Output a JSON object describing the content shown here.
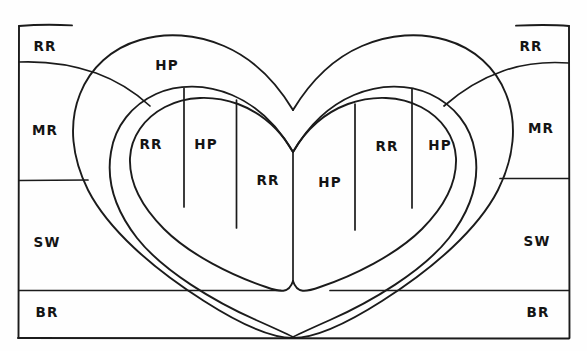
{
  "figure": {
    "kind": "hand-drawn-heart-quilting-pattern-diagram",
    "ink_color": "#1b1b1b",
    "background_color": "#ffffff",
    "canvas": {
      "width": 587,
      "height": 351
    }
  },
  "legend_codes": {
    "RR": "RR",
    "HP": "HP",
    "MR": "MR",
    "SW": "SW",
    "BR": "BR"
  },
  "labels": {
    "outer_left": [
      {
        "id": "left-rr",
        "text": "RR",
        "x": 45,
        "y": 47
      },
      {
        "id": "left-mr",
        "text": "MR",
        "x": 45,
        "y": 131
      },
      {
        "id": "left-sw",
        "text": "SW",
        "x": 47,
        "y": 243
      },
      {
        "id": "left-br",
        "text": "BR",
        "x": 47,
        "y": 313
      }
    ],
    "outer_right": [
      {
        "id": "right-rr",
        "text": "RR",
        "x": 531,
        "y": 47
      },
      {
        "id": "right-mr",
        "text": "MR",
        "x": 541,
        "y": 129
      },
      {
        "id": "right-sw",
        "text": "SW",
        "x": 537,
        "y": 242
      },
      {
        "id": "right-br",
        "text": "BR",
        "x": 538,
        "y": 313
      }
    ],
    "heart_band": [
      {
        "id": "band-hp",
        "text": "HP",
        "x": 167,
        "y": 66
      }
    ],
    "heart_inner": [
      {
        "id": "inner-1",
        "text": "RR",
        "x": 151,
        "y": 145
      },
      {
        "id": "inner-2",
        "text": "HP",
        "x": 206,
        "y": 145
      },
      {
        "id": "inner-3",
        "text": "RR",
        "x": 268,
        "y": 181
      },
      {
        "id": "inner-4",
        "text": "HP",
        "x": 330,
        "y": 183
      },
      {
        "id": "inner-5",
        "text": "RR",
        "x": 387,
        "y": 147
      },
      {
        "id": "inner-6",
        "text": "HP",
        "x": 440,
        "y": 146
      }
    ]
  },
  "geometry": {
    "border_rect": {
      "left": 18,
      "top": 25,
      "right": 569,
      "bottom": 338
    },
    "horizontal_band_lines": [
      {
        "id": "left-rr-mr",
        "y": 62,
        "x_from": 18,
        "x_to": 62
      },
      {
        "id": "right-rr-mr",
        "y": 63,
        "x_from": 524,
        "x_to": 569
      },
      {
        "id": "left-mr-sw",
        "y": 180,
        "x_from": 18,
        "x_to": 88
      },
      {
        "id": "right-mr-sw",
        "y": 178,
        "x_from": 500,
        "x_to": 569
      },
      {
        "id": "left-sw-br",
        "y": 290,
        "x_from": 18,
        "x_to": 281
      },
      {
        "id": "right-sw-br",
        "y": 290,
        "x_from": 330,
        "x_to": 569
      }
    ],
    "heart": {
      "outer_top_notch_y": 110,
      "outer_bottom_point": {
        "x": 293,
        "y": 338
      },
      "mid_top_notch_y": 152,
      "mid_bottom_point": {
        "x": 293,
        "y": 281
      },
      "inner_top_notch_y": 152,
      "inner_bottom_point": {
        "x": 293,
        "y": 281
      }
    },
    "inner_dividers": [
      {
        "id": "div-1",
        "x_top": 184,
        "y_top": 88,
        "x_bot": 184,
        "y_bot": 207
      },
      {
        "id": "div-2",
        "x_top": 236,
        "y_top": 100,
        "x_bot": 236,
        "y_bot": 228
      },
      {
        "id": "div-3",
        "x_top": 293,
        "y_top": 152,
        "x_bot": 293,
        "y_bot": 281
      },
      {
        "id": "div-4",
        "x_top": 355,
        "y_top": 104,
        "x_bot": 355,
        "y_bot": 230
      },
      {
        "id": "div-5",
        "x_top": 412,
        "y_top": 88,
        "x_bot": 412,
        "y_bot": 208
      }
    ]
  }
}
